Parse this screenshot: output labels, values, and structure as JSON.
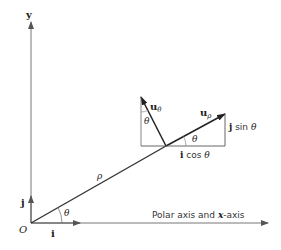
{
  "diagram": {
    "labels": {
      "y_axis": "y",
      "origin": "O",
      "i_vec": "i",
      "j_vec": "j",
      "theta_origin": "θ",
      "rho": "ρ",
      "u_theta_main": "u",
      "u_theta_sub": "θ",
      "u_rho_main": "u",
      "u_rho_sub": "ρ",
      "theta_left": "θ",
      "theta_right": "θ",
      "j_sin": "j",
      "sin_text": " sin ",
      "sin_theta": "θ",
      "i_cos": "i",
      "cos_text": " cos ",
      "cos_theta": "θ",
      "polar_axis_pre": "Polar axis and ",
      "polar_axis_x": "x",
      "polar_axis_post": "-axis"
    },
    "colors": {
      "axis": "#777777",
      "vector": "#333333",
      "thin": "#555555"
    }
  }
}
